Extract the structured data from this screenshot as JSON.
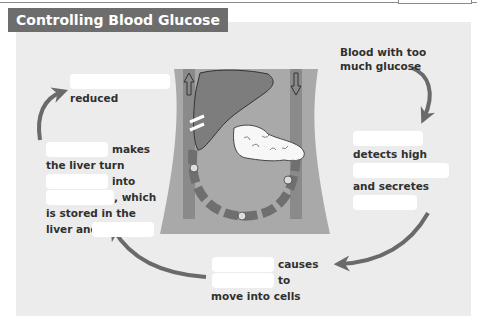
{
  "title": "Controlling Blood Glucose",
  "steps": {
    "start": {
      "line1": "Blood with too",
      "line2": "much glucose"
    },
    "pancreas": {
      "detects": "detects high",
      "secretes": "and secretes"
    },
    "insulin": {
      "causes": "causes",
      "to": "to",
      "move": "move into cells"
    },
    "liver": {
      "makes": "makes",
      "turn": "the liver turn",
      "into": "into",
      "which": ", which",
      "stored": "is stored in the",
      "liver_and": "liver and"
    },
    "end": {
      "reduced": "reduced"
    }
  },
  "blanks": [
    "blank-reduced-subject",
    "blank-pancreas-organ",
    "blank-high-what",
    "blank-secretes-what",
    "blank-causes-subject",
    "blank-to-subject",
    "blank-makes-subject",
    "blank-turn-what",
    "blank-into-what",
    "blank-liver-and"
  ],
  "colors": {
    "panel": "#ececec",
    "title_bg": "#6d6d6d",
    "arrow": "#6a6a6a",
    "body": "#a9a9a9",
    "organ": "#7d7d7d",
    "vessel": "#8a8a8a"
  }
}
